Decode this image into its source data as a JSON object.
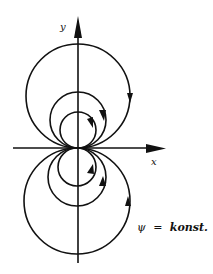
{
  "figure": {
    "axes": {
      "x_label": "x",
      "y_label": "y",
      "origin": [
        78,
        148
      ]
    },
    "annotation": {
      "symbol": "ψ",
      "equals": "=",
      "text": "konst."
    },
    "streamlines": {
      "description": "Circles tangent to x-axis at origin (dipole streamlines), arrows indicating flow direction",
      "upper_circles_radii": [
        52,
        28,
        18
      ],
      "lower_circles_radii": [
        53,
        29,
        19
      ],
      "direction": "clockwise on right side (downward arrows)"
    },
    "colors": {
      "line": "#111111",
      "background": "#ffffff"
    }
  }
}
